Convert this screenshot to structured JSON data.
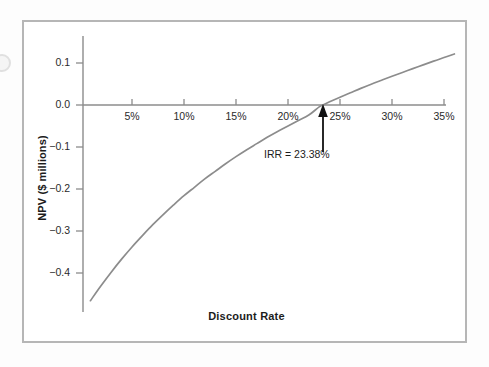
{
  "figure": {
    "frame_color": "#b6b6b6",
    "background": "#ffffff"
  },
  "chart_data": {
    "type": "line",
    "title": "",
    "subtitle": "",
    "xlabel": "Discount Rate",
    "ylabel": "NPV ($ millions)",
    "xlim": [
      0,
      36.5
    ],
    "ylim": [
      -0.48,
      0.155
    ],
    "grid": false,
    "legend": null,
    "x_tick_labels": [
      "5%",
      "10%",
      "15%",
      "20%",
      "25%",
      "30%",
      "35%"
    ],
    "x_tick_values": [
      5,
      10,
      15,
      20,
      25,
      30,
      35
    ],
    "y_tick_labels": [
      "0.1",
      "0.0",
      "−0.1",
      "−0.2",
      "−0.3",
      "−0.4"
    ],
    "y_tick_values": [
      0.1,
      0.0,
      -0.1,
      -0.2,
      -0.3,
      -0.4
    ],
    "series": [
      {
        "name": "NPV profile",
        "color": "#8c8c8c",
        "x": [
          1.0,
          2.0,
          3.0,
          4.0,
          5.0,
          6.0,
          7.0,
          8.0,
          9.0,
          10.0,
          11.0,
          12.0,
          13.0,
          14.0,
          15.0,
          16.0,
          17.0,
          18.0,
          19.0,
          20.0,
          21.0,
          22.0,
          23.0,
          23.38,
          24.0,
          25.0,
          26.0,
          27.0,
          28.0,
          29.0,
          30.0,
          31.0,
          32.0,
          33.0,
          34.0,
          35.0,
          36.0
        ],
        "y": [
          -0.466,
          -0.431,
          -0.398,
          -0.367,
          -0.338,
          -0.311,
          -0.285,
          -0.261,
          -0.238,
          -0.216,
          -0.196,
          -0.176,
          -0.158,
          -0.14,
          -0.123,
          -0.107,
          -0.092,
          -0.077,
          -0.063,
          -0.05,
          -0.037,
          -0.024,
          -0.0045,
          0.0,
          0.0075,
          0.0185,
          0.029,
          0.0395,
          0.0495,
          0.059,
          0.0685,
          0.0775,
          0.0865,
          0.0955,
          0.1045,
          0.113,
          0.1215
        ]
      }
    ],
    "annotations": [
      {
        "name": "irr-annotation",
        "text": "IRR = 23.38%",
        "x": 23.38,
        "y": 0.0,
        "marker": "up-arrow"
      }
    ],
    "axis_color": "#8c8c8c",
    "line_color": "#8c8c8c",
    "arrow_color": "#111111"
  }
}
